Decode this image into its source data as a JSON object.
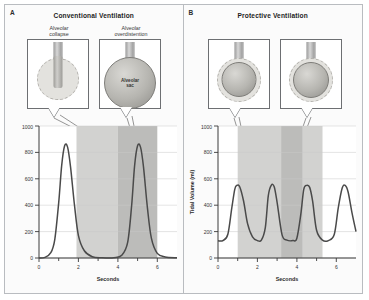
{
  "figure": {
    "panels": [
      {
        "letter": "A",
        "title": "Conventional Ventilation",
        "callouts": [
          {
            "label": "Alveolar\ncollapse",
            "inner_label": ""
          },
          {
            "label": "Alveolar\noverdistention",
            "inner_label": "Alveolar\nsac"
          }
        ],
        "chart": {
          "ylabel": "Tidal Volume (ml)",
          "xlabel": "Seconds",
          "yticks": [
            "0",
            "200",
            "400",
            "600",
            "800",
            "1000"
          ],
          "xticks": [
            "0",
            "2",
            "4",
            "6"
          ]
        }
      },
      {
        "letter": "B",
        "title": "Protective Ventilation",
        "callouts": [
          {
            "label": "",
            "inner_label": ""
          },
          {
            "label": "",
            "inner_label": ""
          }
        ],
        "chart": {
          "ylabel": "Tidal Volume (ml)",
          "xlabel": "Seconds",
          "yticks": [
            "0",
            "200",
            "400",
            "600",
            "800",
            "1000"
          ],
          "xticks": [
            "0",
            "2",
            "4",
            "6"
          ]
        }
      }
    ]
  },
  "chart_data": [
    {
      "type": "line",
      "title": "Conventional Ventilation",
      "xlabel": "Seconds",
      "ylabel": "Tidal Volume (ml)",
      "xlim": [
        0,
        7
      ],
      "ylim": [
        0,
        1000
      ],
      "yticks": [
        0,
        200,
        400,
        600,
        800,
        1000
      ],
      "xticks": [
        0,
        2,
        4,
        6
      ],
      "grid": true,
      "legend": "none",
      "peak_value": 850,
      "baseline_value": 0,
      "breaths": 2,
      "peak_times": [
        1.3,
        5.0
      ],
      "shaded_bands": [
        {
          "x0": 1.9,
          "x1": 4.0,
          "shade": "light"
        },
        {
          "x0": 4.0,
          "x1": 6.0,
          "shade": "dark"
        }
      ],
      "x": [
        0,
        0.3,
        0.6,
        0.8,
        1.0,
        1.15,
        1.3,
        1.45,
        1.6,
        1.8,
        2.0,
        2.3,
        2.7,
        3.2,
        3.8,
        4.2,
        4.5,
        4.7,
        4.85,
        5.0,
        5.15,
        5.3,
        5.5,
        5.7,
        6.0,
        6.4,
        7.0
      ],
      "y": [
        0,
        5,
        40,
        140,
        420,
        700,
        850,
        840,
        690,
        400,
        170,
        55,
        10,
        2,
        2,
        20,
        120,
        400,
        700,
        850,
        840,
        690,
        380,
        150,
        35,
        8,
        2
      ]
    },
    {
      "type": "line",
      "title": "Protective Ventilation",
      "xlabel": "Seconds",
      "ylabel": "Tidal Volume (ml)",
      "xlim": [
        0,
        7
      ],
      "ylim": [
        0,
        1000
      ],
      "yticks": [
        0,
        200,
        400,
        600,
        800,
        1000
      ],
      "xticks": [
        0,
        2,
        4,
        6
      ],
      "grid": true,
      "legend": "none",
      "peak_value": 550,
      "baseline_value": 130,
      "breaths": 4,
      "peak_times": [
        0.95,
        2.7,
        4.5,
        6.5
      ],
      "shaded_bands": [
        {
          "x0": 1.0,
          "x1": 3.2,
          "shade": "light"
        },
        {
          "x0": 3.2,
          "x1": 4.3,
          "shade": "dark"
        },
        {
          "x0": 4.3,
          "x1": 5.3,
          "shade": "light"
        }
      ],
      "x": [
        0,
        0.25,
        0.5,
        0.7,
        0.85,
        0.95,
        1.1,
        1.3,
        1.5,
        1.75,
        2.0,
        2.2,
        2.4,
        2.55,
        2.7,
        2.85,
        3.0,
        3.25,
        3.5,
        3.8,
        4.0,
        4.2,
        4.35,
        4.5,
        4.65,
        4.8,
        5.0,
        5.3,
        5.6,
        5.9,
        6.1,
        6.3,
        6.45,
        6.6,
        6.8,
        7.0
      ],
      "y": [
        130,
        132,
        180,
        380,
        520,
        550,
        540,
        430,
        260,
        160,
        132,
        135,
        230,
        470,
        550,
        540,
        420,
        175,
        135,
        132,
        150,
        330,
        520,
        550,
        535,
        430,
        210,
        135,
        132,
        180,
        380,
        530,
        550,
        500,
        340,
        200
      ]
    }
  ]
}
